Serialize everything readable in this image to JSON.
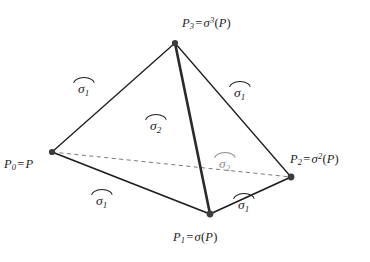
{
  "figure": {
    "background_color": "#ffffff",
    "stroke_color": "#1d1d1d",
    "faded_color": "#8d8d8d",
    "vertex_dot_color": "#3c3c3c"
  },
  "vertices": [
    {
      "id": "P0",
      "label_plain": "P0 = P",
      "base": "P",
      "sub": "0",
      "op": "=",
      "rhs_base": "P",
      "rhs_sup": "",
      "x": 52,
      "y": 152,
      "label_x": 4,
      "label_y": 158
    },
    {
      "id": "P1",
      "label_plain": "P1 = σ(P)",
      "base": "P",
      "sub": "1",
      "op": "=",
      "rhs_base": "σ",
      "rhs_sup": "",
      "x": 210,
      "y": 214,
      "label_x": 173,
      "label_y": 231
    },
    {
      "id": "P2",
      "label_plain": "P2 = σ^2(P)",
      "base": "P",
      "sub": "2",
      "op": "=",
      "rhs_base": "σ",
      "rhs_sup": "2",
      "x": 291,
      "y": 177,
      "label_x": 290,
      "label_y": 152
    },
    {
      "id": "P3",
      "label_plain": "P3 = σ^3(P)",
      "base": "P",
      "sub": "3",
      "op": "=",
      "rhs_base": "σ",
      "rhs_sup": "3",
      "x": 175,
      "y": 43,
      "label_x": 182,
      "label_y": 16
    }
  ],
  "vertex_labels": {
    "p0": {
      "base": "P",
      "sub": "0",
      "op": "=",
      "rhs": "P",
      "sup": "",
      "open": "",
      "close": ""
    },
    "p1": {
      "base": "P",
      "sub": "1",
      "op": "=",
      "rhs": "σ",
      "sup": "",
      "open": "(",
      "close": ")",
      "arg": "P"
    },
    "p2": {
      "base": "P",
      "sub": "2",
      "op": "=",
      "rhs": "σ",
      "sup": "2",
      "open": "(",
      "close": ")",
      "arg": "P"
    },
    "p3": {
      "base": "P",
      "sub": "3",
      "op": "=",
      "rhs": "σ",
      "sup": "3",
      "open": "(",
      "close": ")",
      "arg": "P"
    }
  },
  "edges": [
    {
      "id": "e-p0-p3",
      "from": "P0",
      "to": "P3",
      "style": "solid",
      "width": 1.3,
      "x1": 52,
      "y1": 152,
      "x2": 175,
      "y2": 43
    },
    {
      "id": "e-p3-p2",
      "from": "P3",
      "to": "P2",
      "style": "solid",
      "width": 1.3,
      "x1": 175,
      "y1": 43,
      "x2": 291,
      "y2": 177
    },
    {
      "id": "e-p0-p1",
      "from": "P0",
      "to": "P1",
      "style": "solid",
      "width": 1.6,
      "x1": 52,
      "y1": 152,
      "x2": 210,
      "y2": 214
    },
    {
      "id": "e-p1-p2",
      "from": "P1",
      "to": "P2",
      "style": "solid",
      "width": 1.6,
      "x1": 210,
      "y1": 214,
      "x2": 291,
      "y2": 177
    },
    {
      "id": "e-p3-p1",
      "from": "P3",
      "to": "P1",
      "style": "solid",
      "width": 2.6,
      "x1": 175,
      "y1": 43,
      "x2": 210,
      "y2": 214
    },
    {
      "id": "e-p0-p2",
      "from": "P0",
      "to": "P2",
      "style": "dashed",
      "width": 1.0,
      "x1": 52,
      "y1": 152,
      "x2": 291,
      "y2": 177
    }
  ],
  "edge_labels": [
    {
      "id": "lab-sigma1-upper-left",
      "symbol": "σ",
      "sub": "1",
      "faded": false,
      "x": 78,
      "y": 76,
      "edge": "e-p0-p3"
    },
    {
      "id": "lab-sigma1-upper-right",
      "symbol": "σ",
      "sub": "1",
      "faded": false,
      "x": 234,
      "y": 80,
      "edge": "e-p3-p2"
    },
    {
      "id": "lab-sigma2-center",
      "symbol": "σ",
      "sub": "2",
      "faded": false,
      "x": 150,
      "y": 113,
      "edge": "face-front"
    },
    {
      "id": "lab-sigma2-hidden",
      "symbol": "σ",
      "sub": "2",
      "faded": true,
      "x": 219,
      "y": 151,
      "edge": "face-hidden"
    },
    {
      "id": "lab-sigma1-lower-left",
      "symbol": "σ",
      "sub": "1",
      "faded": false,
      "x": 96,
      "y": 188,
      "edge": "e-p0-p1"
    },
    {
      "id": "lab-sigma1-lower-right",
      "symbol": "σ",
      "sub": "1",
      "faded": false,
      "x": 238,
      "y": 192,
      "edge": "e-p1-p2"
    }
  ]
}
